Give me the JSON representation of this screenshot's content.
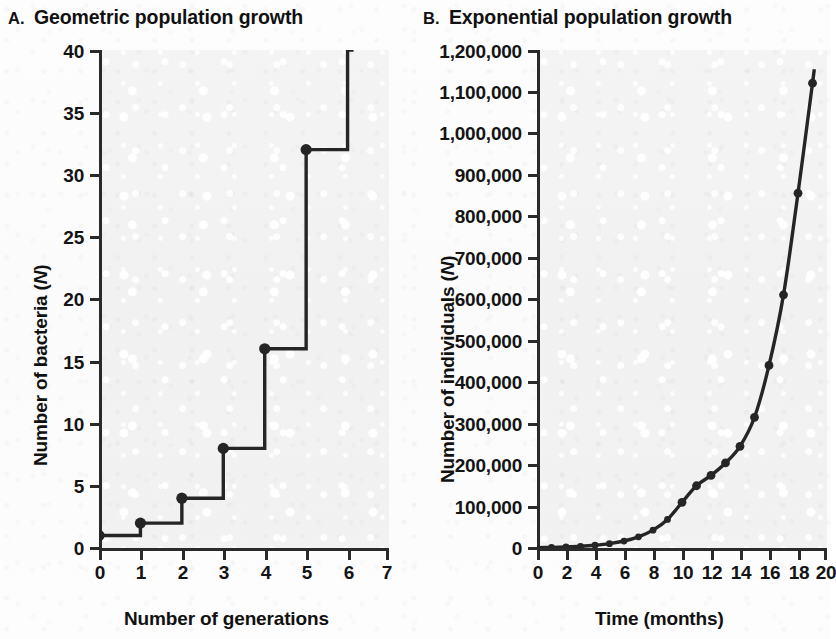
{
  "figure": {
    "panels": [
      {
        "letter": "A.",
        "title": "Geometric population growth",
        "y_axis_title_text": "Number of bacteria (",
        "y_axis_title_italic": "N",
        "y_axis_title_tail": ")",
        "x_axis_title": "Number of generations",
        "y_ticks": [
          "0",
          "5",
          "10",
          "15",
          "20",
          "25",
          "30",
          "35",
          "40"
        ],
        "x_ticks": [
          "0",
          "1",
          "2",
          "3",
          "4",
          "5",
          "6",
          "7"
        ]
      },
      {
        "letter": "B.",
        "title": "Exponential population growth",
        "y_axis_title_text": "Number of individuals (",
        "y_axis_title_italic": "N",
        "y_axis_title_tail": ")",
        "x_axis_title": "Time (months)",
        "y_ticks": [
          "0",
          "100,000",
          "200,000",
          "300,000",
          "400,000",
          "500,000",
          "600,000",
          "700,000",
          "800,000",
          "900,000",
          "1,000,000",
          "1,100,000",
          "1,200,000"
        ],
        "x_ticks": [
          "0",
          "2",
          "4",
          "6",
          "8",
          "10",
          "12",
          "14",
          "16",
          "18",
          "20"
        ]
      }
    ],
    "colors": {
      "line": "#252525",
      "axis": "#2a2a2a",
      "plot_background": "#f0f0f0",
      "page_background": "#fdfdfd",
      "text": "#141414"
    }
  },
  "chart_data": [
    {
      "type": "line",
      "title": "Geometric population growth",
      "subtitle": "",
      "panel_letter": "A.",
      "xlabel": "Number of generations",
      "ylabel": "Number of bacteria (N)",
      "xlim": [
        0,
        7
      ],
      "ylim": [
        0,
        40
      ],
      "xticks": [
        0,
        1,
        2,
        3,
        4,
        5,
        6,
        7
      ],
      "yticks": [
        0,
        5,
        10,
        15,
        20,
        25,
        30,
        35,
        40
      ],
      "grid": false,
      "legend": null,
      "step_style": "post",
      "note": "Each generation the bacteria population doubles; curve exits the top of the plot between generation 6 and 7.",
      "x": [
        0,
        1,
        2,
        3,
        4,
        5,
        6
      ],
      "values": [
        1,
        2,
        4,
        8,
        16,
        32,
        64
      ],
      "markers_drawn_at": [
        0,
        1,
        2,
        3,
        4,
        5
      ],
      "marker_values": [
        1,
        2,
        4,
        8,
        16,
        32
      ]
    },
    {
      "type": "line",
      "title": "Exponential population growth",
      "subtitle": "",
      "panel_letter": "B.",
      "xlabel": "Time (months)",
      "ylabel": "Number of individuals (N)",
      "xlim": [
        0,
        20
      ],
      "ylim": [
        0,
        1200000
      ],
      "xticks": [
        0,
        2,
        4,
        6,
        8,
        10,
        12,
        14,
        16,
        18,
        20
      ],
      "yticks": [
        0,
        100000,
        200000,
        300000,
        400000,
        500000,
        600000,
        700000,
        800000,
        900000,
        1000000,
        1100000,
        1200000
      ],
      "grid": false,
      "legend": null,
      "note": "Smooth exponential increase with a marker plotted at each month; final plotted point near 1,120,000 at month 19.",
      "x": [
        0,
        1,
        2,
        3,
        4,
        5,
        6,
        7,
        8,
        9,
        10,
        11,
        12,
        13,
        14,
        15,
        16,
        17,
        18,
        19
      ],
      "values": [
        1000,
        1600,
        2600,
        4100,
        6600,
        10500,
        16800,
        26900,
        43000,
        68800,
        110000,
        150000,
        175000,
        205000,
        245000,
        315000,
        440000,
        610000,
        855000,
        1120000
      ]
    }
  ]
}
